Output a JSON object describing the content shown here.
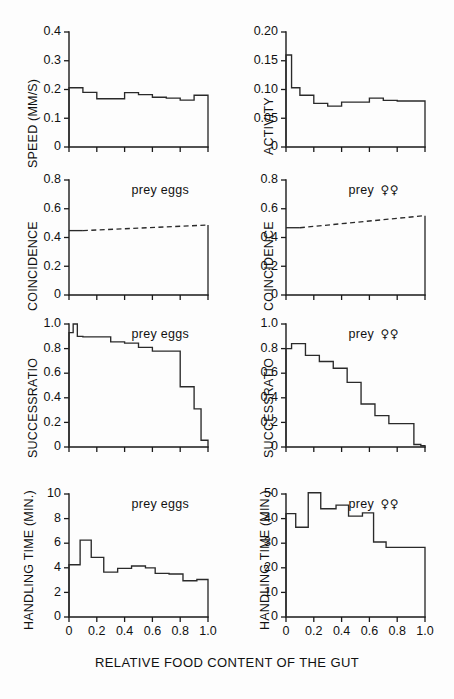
{
  "figure": {
    "page_artifact": "",
    "xaxis_title": "RELATIVE FOOD CONTENT OF THE GUT",
    "x_tick_labels": [
      "0",
      "0.2",
      "0.4",
      "0.6",
      "0.8",
      "1.0"
    ],
    "note_eggs": "prey eggs",
    "note_females": "prey",
    "venus_symbols": "♀♀"
  },
  "chart_data": [
    {
      "id": "speed-eggs",
      "type": "line",
      "title": "",
      "panel_note": "",
      "ylabel": "SPEED (MM/S)",
      "xlabel": "RELATIVE FOOD CONTENT OF THE GUT",
      "xlim": [
        0,
        1.0
      ],
      "ylim": [
        0,
        0.4
      ],
      "y_tick_labels": [
        "0",
        "0.1",
        "0.2",
        "0.3",
        "0.4"
      ],
      "y_ticks": [
        0,
        0.1,
        0.2,
        0.3,
        0.4
      ],
      "x_ticks": [
        0,
        0.2,
        0.4,
        0.6,
        0.8,
        1.0
      ],
      "grid": false,
      "step_edges": [
        0.0,
        0.1,
        0.2,
        0.3,
        0.4,
        0.5,
        0.6,
        0.7,
        0.8,
        0.9,
        1.0
      ],
      "values": [
        0.206,
        0.19,
        0.168,
        0.168,
        0.189,
        0.182,
        0.173,
        0.17,
        0.163,
        0.18
      ]
    },
    {
      "id": "activity-females",
      "type": "line",
      "title": "",
      "panel_note": "",
      "ylabel": "ACTIVITY",
      "xlabel": "RELATIVE FOOD CONTENT OF THE GUT",
      "xlim": [
        0,
        1.0
      ],
      "ylim": [
        0,
        0.2
      ],
      "y_tick_labels": [
        "0",
        "0.05",
        "0.10",
        "0.15",
        "0.20"
      ],
      "y_ticks": [
        0,
        0.05,
        0.1,
        0.15,
        0.2
      ],
      "x_ticks": [
        0,
        0.2,
        0.4,
        0.6,
        0.8,
        1.0
      ],
      "grid": false,
      "step_edges": [
        0.0,
        0.04,
        0.1,
        0.2,
        0.3,
        0.4,
        0.5,
        0.6,
        0.7,
        0.8,
        1.0
      ],
      "values": [
        0.16,
        0.103,
        0.09,
        0.076,
        0.071,
        0.078,
        0.078,
        0.085,
        0.081,
        0.08
      ]
    },
    {
      "id": "coincidence-eggs",
      "type": "line",
      "title": "",
      "panel_note": "prey eggs",
      "ylabel": "COINCIDENCE",
      "xlabel": "RELATIVE FOOD CONTENT OF THE GUT",
      "xlim": [
        0,
        1.0
      ],
      "ylim": [
        0,
        0.8
      ],
      "y_tick_labels": [
        "0",
        "0.2",
        "0.4",
        "0.6",
        "0.8"
      ],
      "y_ticks": [
        0,
        0.2,
        0.4,
        0.6,
        0.8
      ],
      "x_ticks": [
        0,
        0.2,
        0.4,
        0.6,
        0.8,
        1.0
      ],
      "grid": false,
      "solid_x": [
        0.0,
        0.1
      ],
      "solid_y": [
        0.448,
        0.448
      ],
      "dashed_x": [
        0.1,
        1.0
      ],
      "dashed_y": [
        0.448,
        0.487
      ],
      "values": [
        0.448,
        0.487
      ]
    },
    {
      "id": "coincidence-females",
      "type": "line",
      "title": "",
      "panel_note": "prey",
      "ylabel": "COINCIDENCE",
      "xlabel": "RELATIVE FOOD CONTENT OF THE GUT",
      "xlim": [
        0,
        1.0
      ],
      "ylim": [
        0,
        0.8
      ],
      "y_tick_labels": [
        "0",
        "0.2",
        "0.4",
        "0.6",
        "0.8"
      ],
      "y_ticks": [
        0,
        0.2,
        0.4,
        0.6,
        0.8
      ],
      "x_ticks": [
        0,
        0.2,
        0.4,
        0.6,
        0.8,
        1.0
      ],
      "grid": false,
      "solid_x": [
        0.0,
        0.1
      ],
      "solid_y": [
        0.468,
        0.468
      ],
      "dashed_x": [
        0.1,
        1.0
      ],
      "dashed_y": [
        0.468,
        0.552
      ],
      "values": [
        0.468,
        0.552
      ]
    },
    {
      "id": "successratio-eggs",
      "type": "line",
      "title": "",
      "panel_note": "prey eggs",
      "ylabel": "SUCCESSRATIO",
      "xlabel": "RELATIVE FOOD CONTENT OF THE GUT",
      "xlim": [
        0,
        1.0
      ],
      "ylim": [
        0,
        1.0
      ],
      "y_tick_labels": [
        "0",
        "0.2",
        "0.4",
        "0.6",
        "0.8",
        "1.0"
      ],
      "y_ticks": [
        0,
        0.2,
        0.4,
        0.6,
        0.8,
        1.0
      ],
      "x_ticks": [
        0,
        0.2,
        0.4,
        0.6,
        0.8,
        1.0
      ],
      "grid": false,
      "step_edges": [
        0.0,
        0.03,
        0.06,
        0.1,
        0.2,
        0.3,
        0.4,
        0.5,
        0.6,
        0.7,
        0.8,
        0.9,
        0.95,
        1.0
      ],
      "values": [
        0.93,
        1.0,
        0.9,
        0.895,
        0.895,
        0.855,
        0.845,
        0.81,
        0.78,
        0.78,
        0.49,
        0.31,
        0.055
      ]
    },
    {
      "id": "successratio-females",
      "type": "line",
      "title": "",
      "panel_note": "prey",
      "ylabel": "SUCCESSRATIO",
      "xlabel": "RELATIVE FOOD CONTENT OF THE GUT",
      "xlim": [
        0,
        1.0
      ],
      "ylim": [
        0,
        1.0
      ],
      "y_tick_labels": [
        "0",
        "0.2",
        "0.4",
        "0.6",
        "0.8",
        "1.0"
      ],
      "y_ticks": [
        0,
        0.2,
        0.4,
        0.6,
        0.8,
        1.0
      ],
      "x_ticks": [
        0,
        0.2,
        0.4,
        0.6,
        0.8,
        1.0
      ],
      "grid": false,
      "step_edges": [
        0.0,
        0.04,
        0.14,
        0.24,
        0.34,
        0.44,
        0.54,
        0.64,
        0.74,
        0.84,
        0.92,
        0.97,
        1.0
      ],
      "values": [
        0.8,
        0.84,
        0.745,
        0.695,
        0.64,
        0.525,
        0.35,
        0.255,
        0.19,
        0.19,
        0.02,
        0.01
      ]
    },
    {
      "id": "handlingtime-eggs",
      "type": "line",
      "title": "",
      "panel_note": "prey eggs",
      "ylabel": "HANDLING TIME (MIN.)",
      "xlabel": "RELATIVE FOOD CONTENT OF THE GUT",
      "xlim": [
        0,
        1.0
      ],
      "ylim": [
        0,
        10
      ],
      "y_tick_labels": [
        "0",
        "2",
        "4",
        "6",
        "8",
        "10"
      ],
      "y_ticks": [
        0,
        2,
        4,
        6,
        8,
        10
      ],
      "x_ticks": [
        0,
        0.2,
        0.4,
        0.6,
        0.8,
        1.0
      ],
      "grid": false,
      "step_edges": [
        0.0,
        0.08,
        0.16,
        0.25,
        0.35,
        0.45,
        0.55,
        0.62,
        0.72,
        0.82,
        0.92,
        1.0
      ],
      "values": [
        4.25,
        6.25,
        4.85,
        3.65,
        3.95,
        4.15,
        4.0,
        3.55,
        3.5,
        2.95,
        3.05
      ]
    },
    {
      "id": "handlingtime-females",
      "type": "line",
      "title": "",
      "panel_note": "prey",
      "ylabel": "HANDLING TIME (MIN.)",
      "xlabel": "RELATIVE FOOD CONTENT OF THE GUT",
      "xlim": [
        0,
        1.0
      ],
      "ylim": [
        0,
        50
      ],
      "y_tick_labels": [
        "0",
        "10",
        "20",
        "30",
        "40",
        "50"
      ],
      "y_ticks": [
        0,
        10,
        20,
        30,
        40,
        50
      ],
      "x_ticks": [
        0,
        0.2,
        0.4,
        0.6,
        0.8,
        1.0
      ],
      "grid": false,
      "step_edges": [
        0.0,
        0.07,
        0.16,
        0.25,
        0.36,
        0.45,
        0.55,
        0.63,
        0.72,
        0.82,
        1.0
      ],
      "values": [
        42.0,
        36.5,
        50.5,
        44.0,
        45.5,
        41.0,
        42.3,
        30.5,
        28.3,
        28.3
      ]
    }
  ]
}
